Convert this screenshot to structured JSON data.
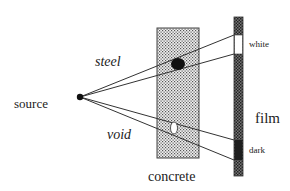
{
  "diagram": {
    "labels": {
      "steel": "steel",
      "void": "void",
      "source": "source",
      "concrete": "concrete",
      "film": "film",
      "white": "white",
      "dark": "dark"
    },
    "colors": {
      "line": "#333333",
      "concrete_fill": "#d6d6d6",
      "film_fill": "#555555",
      "steel_fill": "#111111",
      "void_fill": "#ffffff",
      "dark_section": "#222222",
      "white_section": "#ffffff"
    }
  }
}
